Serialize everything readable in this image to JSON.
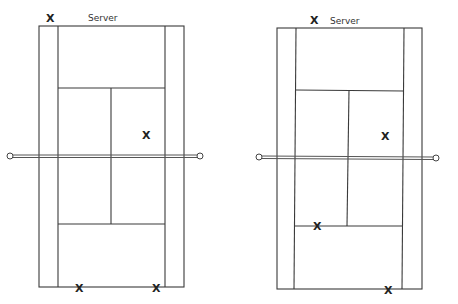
{
  "diagram": {
    "type": "tennis-court-doubles-positions",
    "line_color": "#3a3a3a",
    "courts": [
      {
        "id": "left",
        "server_label": "Server",
        "outer": {
          "x1": 39,
          "x2": 184,
          "y1": 26,
          "y2": 287
        },
        "inner": {
          "x1": 58,
          "x2": 165
        },
        "service_line_top": 88,
        "service_line_bottom": 224,
        "center_line_x": 111,
        "net": {
          "y": 156,
          "x1": 10,
          "x2": 200
        },
        "players": [
          {
            "label": "X",
            "role": "server",
            "x": 50,
            "y": 18
          },
          {
            "label": "X",
            "role": "server-partner",
            "x": 146,
            "y": 135
          },
          {
            "label": "X",
            "role": "receiver",
            "x": 79,
            "y": 288
          },
          {
            "label": "X",
            "role": "receiver-partner",
            "x": 156,
            "y": 288
          }
        ]
      },
      {
        "id": "right",
        "server_label": "Server",
        "outer": {
          "x1": 277,
          "x2": 422,
          "y1": 28,
          "y2": 289
        },
        "inner": {
          "x1": 296,
          "x2": 404
        },
        "service_line_top": 90,
        "service_line_bottom": 226,
        "center_line_x": 348,
        "net": {
          "y": 157,
          "x1": 260,
          "x2": 435
        },
        "players": [
          {
            "label": "X",
            "role": "server",
            "x": 314,
            "y": 20
          },
          {
            "label": "X",
            "role": "server-partner",
            "x": 385,
            "y": 136
          },
          {
            "label": "X",
            "role": "receiver-partner",
            "x": 317,
            "y": 226
          },
          {
            "label": "X",
            "role": "receiver",
            "x": 388,
            "y": 290
          }
        ]
      }
    ]
  }
}
